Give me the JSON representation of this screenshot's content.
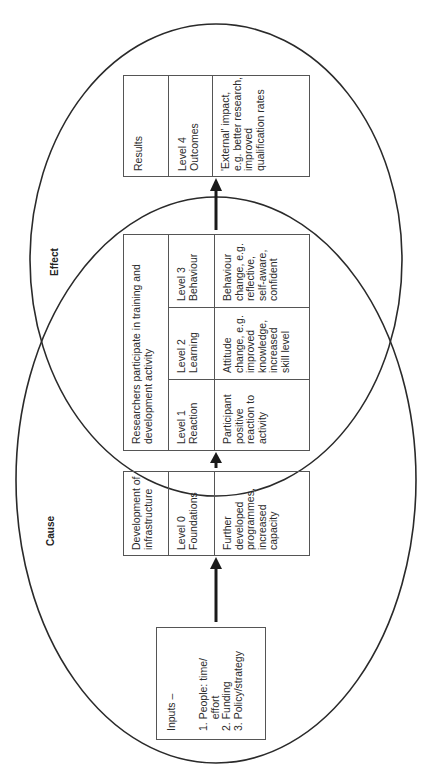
{
  "labels": {
    "cause": "Cause",
    "effect": "Effect"
  },
  "inputs": {
    "title": "Inputs –",
    "items": [
      "1. People: time/\n    effort",
      "2. Funding",
      "3. Policy/strategy"
    ]
  },
  "infrastructure": {
    "header": "Development of\ninfrastructure",
    "level": "Level 0\nFoundations",
    "description": "Further\ndeveloped\nprogrammes,\nincreased\ncapacity"
  },
  "activity": {
    "header": "Researchers participate in training and\ndevelopment activity",
    "levels": [
      {
        "level": "Level 1\nReaction",
        "description": "Participant\npositive\nreaction to\nactivity"
      },
      {
        "level": "Level 2\nLearning",
        "description": "Attitude\nchange, e.g.\nimproved\nknowledge,\nincreased\nskill level"
      },
      {
        "level": "Level 3\nBehaviour",
        "description": "Behaviour\nchange, e.g.\nreflective,\nself-aware,\nconfident"
      }
    ]
  },
  "results": {
    "header": "Results",
    "level": "Level 4\nOutcomes",
    "description": "'External' impact,\ne.g. better research,\nimproved\nqualification rates"
  },
  "colors": {
    "line": "#2a2a2a",
    "box": "#555555",
    "arrow": "#1a1a1a"
  }
}
